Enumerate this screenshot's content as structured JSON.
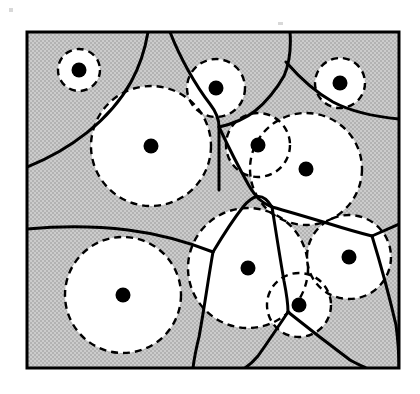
{
  "figure": {
    "name": "voronoi-disk-packing-diagram",
    "type": "geometric-diagram",
    "width": 420,
    "height": 394
  },
  "colors": {
    "background": "#ffffff",
    "region_fill": "#c9c9c9",
    "disk_fill": "#ffffff",
    "frame_stroke": "#000000",
    "voronoi_stroke": "#000000",
    "circle_stroke": "#000000",
    "site_fill": "#000000"
  },
  "frame": {
    "x": 27,
    "y": 32,
    "width": 372,
    "height": 336,
    "stroke_width": 3
  },
  "style": {
    "voronoi_stroke_width": 3,
    "circle_stroke_width": 2.4,
    "circle_dash": "7 5",
    "site_radius": 7.5
  },
  "sites": [
    {
      "id": "s1",
      "label": "site-top-left-small",
      "cx": 79,
      "cy": 70,
      "r": 21
    },
    {
      "id": "s2",
      "label": "site-top-left-large",
      "cx": 151,
      "cy": 146,
      "r": 60
    },
    {
      "id": "s3",
      "label": "site-top-middle",
      "cx": 216,
      "cy": 88,
      "r": 29
    },
    {
      "id": "s4",
      "label": "site-center-upper",
      "cx": 258,
      "cy": 145,
      "r": 32
    },
    {
      "id": "s5",
      "label": "site-top-right-small",
      "cx": 340,
      "cy": 83,
      "r": 25
    },
    {
      "id": "s6",
      "label": "site-right-large",
      "cx": 306,
      "cy": 169,
      "r": 56
    },
    {
      "id": "s7",
      "label": "site-bottom-left",
      "cx": 123,
      "cy": 295,
      "r": 58
    },
    {
      "id": "s8",
      "label": "site-bottom-middle",
      "cx": 248,
      "cy": 268,
      "r": 60
    },
    {
      "id": "s9",
      "label": "site-bottom-small",
      "cx": 299,
      "cy": 305,
      "r": 32
    },
    {
      "id": "s10",
      "label": "site-right-middle",
      "cx": 349,
      "cy": 257,
      "r": 42
    }
  ],
  "voronoi_edges": [
    {
      "id": "e1",
      "label": "edge-top-left-diagonal",
      "d": "M 27 167 C 70 150 110 120 131 82 C 142 62 146 44 148 32"
    },
    {
      "id": "e2",
      "label": "edge-top-center-left",
      "d": "M 170 32 C 180 58 196 86 210 104 C 217 113 219 120 219 127 L 219 190"
    },
    {
      "id": "e3",
      "label": "edge-top-center-right",
      "d": "M 219 127 C 232 124 245 119 255 111 C 266 102 276 90 284 76 C 290 62 291 45 290 32"
    },
    {
      "id": "e4",
      "label": "edge-upper-right-branch",
      "d": "M 219 127 C 228 146 238 166 248 184 C 256 198 262 203 272 207"
    },
    {
      "id": "e5",
      "label": "edge-right-outer",
      "d": "M 286 62 C 300 78 315 92 333 102 C 352 112 378 117 399 119"
    },
    {
      "id": "e6",
      "label": "edge-mid-horizontal",
      "d": "M 27 229 C 60 226 95 226 128 230 C 160 234 190 243 213 252"
    },
    {
      "id": "e7",
      "label": "edge-mid-to-center",
      "d": "M 213 252 C 222 237 232 221 243 207 C 252 196 262 190 272 207"
    },
    {
      "id": "e8",
      "label": "edge-center-down",
      "d": "M 213 252 C 208 280 204 310 199 337 C 196 349 194 360 193 368"
    },
    {
      "id": "e9",
      "label": "edge-right-upper-branch",
      "d": "M 272 207 C 290 212 310 218 330 224 C 346 229 360 233 372 236"
    },
    {
      "id": "e10",
      "label": "edge-right-to-corner",
      "d": "M 372 236 C 381 232 390 228 399 224"
    },
    {
      "id": "e11",
      "label": "edge-right-down-branch",
      "d": "M 372 236 C 380 262 389 295 396 325 C 398 340 399 356 399 368"
    },
    {
      "id": "e12",
      "label": "edge-bottom-center-branch",
      "d": "M 272 207 C 276 232 280 258 284 281 C 287 296 288 305 288 312"
    },
    {
      "id": "e13",
      "label": "edge-bottom-left-fork",
      "d": "M 288 312 C 278 327 268 342 258 356 C 252 363 248 366 245 368"
    },
    {
      "id": "e14",
      "label": "edge-bottom-right-fork",
      "d": "M 288 312 C 308 328 330 345 350 360 C 357 364 362 366 366 368"
    }
  ],
  "caption": ""
}
